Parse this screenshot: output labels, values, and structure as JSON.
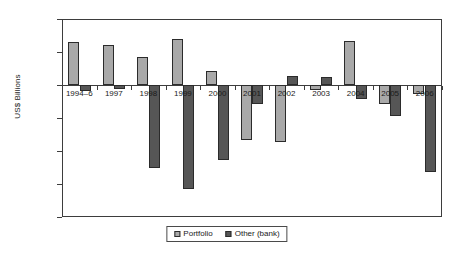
{
  "chart_data": {
    "type": "bar",
    "title": "",
    "xlabel": "",
    "ylabel": "US$ Billions",
    "ylim": [
      -200,
      100
    ],
    "yticks": [
      100,
      50,
      0,
      -50,
      -100,
      -150,
      -200
    ],
    "ytick_labels": [
      "100",
      "50",
      "0",
      "−50",
      "−100",
      "−150",
      "−200"
    ],
    "grid": false,
    "legend_position": "bottom-center",
    "categories": [
      "1994–6",
      "1997",
      "1998",
      "1999",
      "2000",
      "2001",
      "2002",
      "2003",
      "2004",
      "2005",
      "2006"
    ],
    "series": [
      {
        "name": "Portfolio",
        "color": "#a9a9a9",
        "values": [
          65,
          61,
          43,
          70,
          21,
          -83,
          -87,
          -7,
          66,
          -29,
          -14
        ]
      },
      {
        "name": "Other (bank)",
        "color": "#565656",
        "values": [
          -9,
          -6,
          -125,
          -157,
          -113,
          -29,
          13,
          12,
          -21,
          -47,
          -132
        ]
      }
    ]
  },
  "legend": {
    "entries": [
      {
        "label": "Portfolio",
        "swatch": "portfolio-swatch"
      },
      {
        "label": "Other (bank)",
        "swatch": "other-bank-swatch"
      }
    ]
  }
}
